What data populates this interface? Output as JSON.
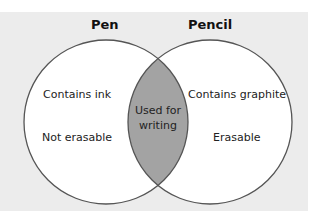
{
  "diagram": {
    "type": "venn",
    "sets": [
      {
        "name": "Pen",
        "items": [
          "Contains ink",
          "Not erasable"
        ]
      },
      {
        "name": "Pencil",
        "items": [
          "Contains graphite",
          "Erasable"
        ]
      }
    ],
    "intersection": {
      "line1": "Used for",
      "line2": "writing"
    },
    "colors": {
      "background": "#ececec",
      "circle_fill": "#ffffff",
      "intersection_fill": "#a3a3a3",
      "stroke": "#555555"
    }
  }
}
